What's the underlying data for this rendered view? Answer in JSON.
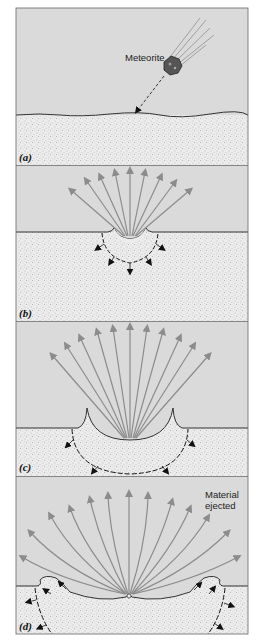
{
  "figure": {
    "top_caption_fragment": "Stages of crater formation",
    "colors": {
      "sky": "#d9d9d9",
      "ground": "#ebebeb",
      "ground_speckle": "#8a8a8a",
      "ejecta_arrow": "#8c8c8c",
      "shock_arrow": "#111111",
      "border": "#555555"
    },
    "panels": [
      {
        "id": "a",
        "label": "(a)",
        "annotation": "Meteorite",
        "description": "Meteorite approaching surface along diagonal path"
      },
      {
        "id": "b",
        "label": "(b)",
        "description": "Impact: small crater, ejecta fan of 9 arrows, shock wave arrows in ground"
      },
      {
        "id": "c",
        "label": "(c)",
        "description": "Crater deepens; ejecta fan of 11 arrows; shock front expands"
      },
      {
        "id": "d",
        "label": "(d)",
        "annotation": "Material ejected",
        "description": "Ejecta curtain spreads with rim overturn; shock front propagates outward"
      }
    ]
  }
}
